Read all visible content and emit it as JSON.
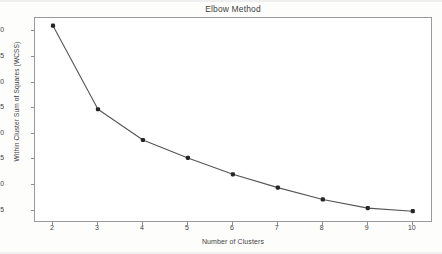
{
  "chart_data": {
    "type": "line",
    "title": "Elbow Method",
    "xlabel": "Number of Clusters",
    "ylabel": "Within Cluster Sum of Squares (WCSS)",
    "x": [
      2,
      3,
      4,
      5,
      6,
      7,
      8,
      9,
      10
    ],
    "values": [
      41.1,
      24.8,
      18.8,
      15.3,
      12.1,
      9.5,
      7.2,
      5.5,
      4.9
    ],
    "series": [
      {
        "name": "WCSS",
        "values": [
          41.1,
          24.8,
          18.8,
          15.3,
          12.1,
          9.5,
          7.2,
          5.5,
          4.9
        ]
      }
    ],
    "xticks": [
      "2",
      "3",
      "4",
      "5",
      "6",
      "7",
      "8",
      "9",
      "10"
    ],
    "yticks": [
      "5",
      "10",
      "15",
      "20",
      "25",
      "30",
      "35",
      "40"
    ],
    "xlim": [
      1.6,
      10.45
    ],
    "ylim": [
      2.6,
      42.6
    ],
    "grid": false,
    "legend": false,
    "marker": "square-dot",
    "line_color": "#555555",
    "marker_color": "#262626",
    "frame_color": "#9a9a9a",
    "background_color": "#ffffff"
  }
}
